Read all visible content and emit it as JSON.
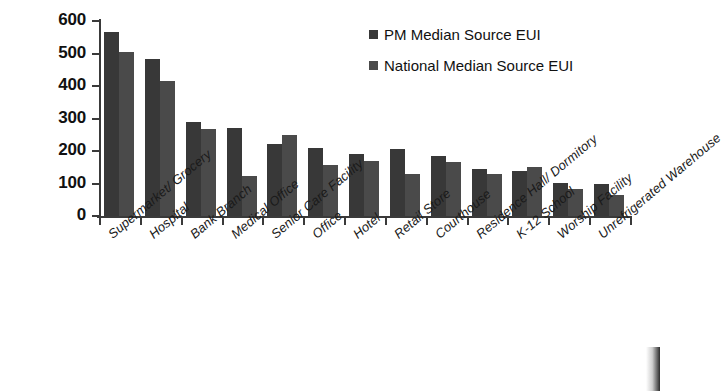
{
  "chart_data": {
    "type": "bar",
    "title": "",
    "xlabel": "",
    "ylabel": "Source EUI (kBtu/ft2)",
    "ylabel_text": "Source EUI (kBtu/ft",
    "ylabel_sup": "2",
    "ylabel_close": ")",
    "ylim": [
      0,
      600
    ],
    "ytick_step": 100,
    "yticks": [
      "0",
      "100",
      "200",
      "300",
      "400",
      "500",
      "600"
    ],
    "grid": false,
    "legend_position": "top-right",
    "categories": [
      "Supermarket/ Grocery",
      "Hospital",
      "Bank Branch",
      "Medical Office",
      "Senior Care Facility",
      "Office",
      "Hotel",
      "Retail Store",
      "Courthouse",
      "Residence Hall/ Dormitory",
      "K-12 School",
      "Worship Facility",
      "Unrefrigerated Warehouse"
    ],
    "series": [
      {
        "name": "PM Median Source EUI",
        "color": "#383838",
        "values": [
          565,
          483,
          290,
          270,
          222,
          210,
          192,
          205,
          186,
          145,
          138,
          103,
          97
        ]
      },
      {
        "name": "National Median Source EUI",
        "color": "#4a4a4a",
        "values": [
          505,
          414,
          268,
          122,
          250,
          157,
          168,
          128,
          165,
          130,
          152,
          82,
          65
        ]
      }
    ]
  },
  "legend": {
    "items": [
      {
        "label": "PM Median Source EUI"
      },
      {
        "label": "National Median Source EUI"
      }
    ]
  }
}
